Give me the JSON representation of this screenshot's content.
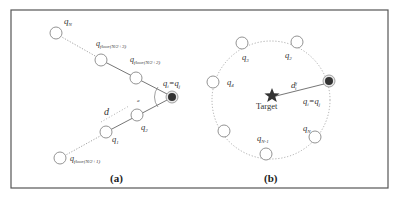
{
  "figure": {
    "frame": {
      "x": 11,
      "y": 10,
      "width": 377,
      "height": 178,
      "stroke": "#555555"
    },
    "colors": {
      "node_stroke": "#888888",
      "leader_fill": "#333333",
      "line": "#666666",
      "dotted": "#999999",
      "star": "#333333"
    }
  },
  "panel_a": {
    "caption": "(a)",
    "labels": {
      "qN": {
        "base": "q",
        "sub": "N"
      },
      "q_floor3": {
        "base": "q",
        "sub": "floor(N/2+3)"
      },
      "q_floor2": {
        "base": "q",
        "sub": "floor(N/2+2)"
      },
      "qi_qj": {
        "base": "q",
        "sub": "i",
        "eq": "=q",
        "sub2": "j"
      },
      "q2": {
        "base": "q",
        "sub": "2"
      },
      "q1": {
        "base": "q",
        "sub": "1"
      },
      "q_floor1": {
        "base": "q",
        "sub": "floor(N/2+1)"
      },
      "d": "d",
      "alpha": "a"
    }
  },
  "panel_b": {
    "caption": "(b)",
    "target_label": "Target",
    "labels": {
      "q3": {
        "base": "q",
        "sub": "3"
      },
      "q2": {
        "base": "q",
        "sub": "2"
      },
      "q4": {
        "base": "q",
        "sub": "4"
      },
      "qi_qj": {
        "base": "q",
        "sub": "i",
        "eq": "=q",
        "sub2": "j"
      },
      "dfi": {
        "base": "d",
        "sup": "f",
        "sub": "i"
      },
      "qN1": {
        "base": "q",
        "sub": "N-1"
      },
      "qN": {
        "base": "q",
        "sub": "N"
      }
    }
  }
}
